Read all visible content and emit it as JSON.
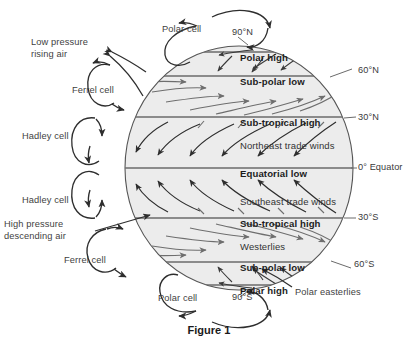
{
  "figure": {
    "caption": "Figure 1"
  },
  "colors": {
    "globe_fill": "#ececec",
    "globe_stroke": "#555555",
    "band_line": "#6b6b6b",
    "arrow_dark": "#2e2e2e",
    "arrow_grey": "#6e6e6e",
    "text": "#333333",
    "caption": "#1a1a1a"
  },
  "globe": {
    "center_x": 239,
    "center_y": 168,
    "radius_x": 114,
    "radius_y": 122
  },
  "pressure_bands": [
    {
      "id": "polar-high-north",
      "label": "Polar high",
      "latitude": "90°N",
      "y": 52,
      "line": false
    },
    {
      "id": "sub-polar-low-north",
      "label": "Sub-polar low",
      "latitude": "60°N",
      "y": 76,
      "line": true
    },
    {
      "id": "sub-tropical-high-north",
      "label": "Sub-tropical high",
      "latitude": "30°N",
      "y": 117,
      "line": true
    },
    {
      "id": "equatorial-low",
      "label": "Equatorial low",
      "latitude": "0° Equator",
      "y": 168,
      "line": true
    },
    {
      "id": "sub-tropical-high-south",
      "label": "Sub-tropical high",
      "latitude": "30°S",
      "y": 218,
      "line": true
    },
    {
      "id": "sub-polar-low-south",
      "label": "Sub-polar low",
      "latitude": "60°S",
      "y": 262,
      "line": true
    },
    {
      "id": "polar-high-south",
      "label": "Polar high",
      "latitude": "90°S",
      "y": 285,
      "line": false
    }
  ],
  "wind_belts": [
    {
      "id": "northeast-trade-winds",
      "label": "Northeast trade winds",
      "x": 239,
      "y": 140
    },
    {
      "id": "southeast-trade-winds",
      "label": "Southeast trade winds",
      "x": 239,
      "y": 196
    },
    {
      "id": "westerlies",
      "label": "Westerlies",
      "x": 239,
      "y": 241
    }
  ],
  "latitude_labels": [
    {
      "id": "lat-90n",
      "text": "90°N",
      "x": 232,
      "y": 33
    },
    {
      "id": "lat-60n",
      "text": "60°N",
      "x": 358,
      "y": 71
    },
    {
      "id": "lat-30n",
      "text": "30°N",
      "x": 358,
      "y": 118
    },
    {
      "id": "lat-0",
      "text": "0° Equator",
      "x": 358,
      "y": 166
    },
    {
      "id": "lat-30s",
      "text": "30°S",
      "x": 358,
      "y": 217
    },
    {
      "id": "lat-60s",
      "text": "60°S",
      "x": 356,
      "y": 264
    },
    {
      "id": "lat-90s",
      "text": "90°S",
      "x": 232,
      "y": 297
    }
  ],
  "cell_labels": [
    {
      "id": "polar-cell-north",
      "label": "Polar cell",
      "x": 162,
      "y": 29
    },
    {
      "id": "ferrel-cell-north",
      "label": "Ferrel cell",
      "x": 73,
      "y": 90
    },
    {
      "id": "hadley-cell-north",
      "label": "Hadley cell",
      "x": 24,
      "y": 136
    },
    {
      "id": "hadley-cell-south",
      "label": "Hadley cell",
      "x": 24,
      "y": 200
    },
    {
      "id": "ferrel-cell-south",
      "label": "Ferrel cell",
      "x": 66,
      "y": 260
    },
    {
      "id": "polar-cell-south",
      "label": "Polar cell",
      "x": 158,
      "y": 298
    }
  ],
  "annotations": [
    {
      "id": "low-pressure-rising-air",
      "label": "Low pressure\nrising air",
      "x": 32,
      "y": 42
    },
    {
      "id": "high-pressure-descending-air",
      "label": "High pressure\ndescending air",
      "x": 4,
      "y": 224
    },
    {
      "id": "polar-easterlies",
      "label": "Polar easterlies",
      "x": 295,
      "y": 292
    }
  ]
}
